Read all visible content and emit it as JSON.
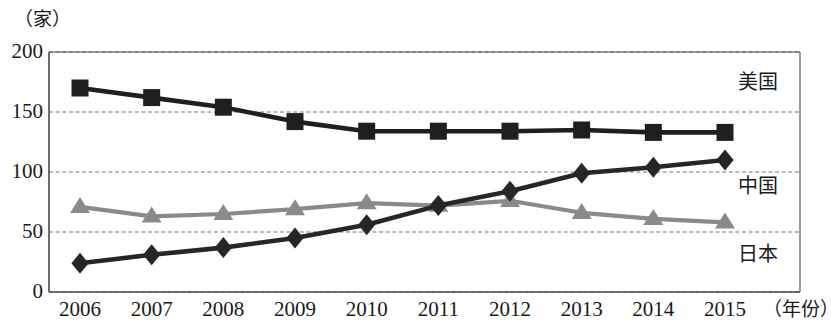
{
  "chart_data": {
    "type": "line",
    "title": "",
    "subtitle": "",
    "xlabel": "（年份）",
    "ylabel": "（家）",
    "categories": [
      "2006",
      "2007",
      "2008",
      "2009",
      "2010",
      "2011",
      "2012",
      "2013",
      "2014",
      "2015"
    ],
    "x": [
      2006,
      2007,
      2008,
      2009,
      2010,
      2011,
      2012,
      2013,
      2014,
      2015
    ],
    "xlim": [
      2006,
      2015
    ],
    "ylim": [
      0,
      200
    ],
    "yticks": [
      0,
      50,
      100,
      150,
      200
    ],
    "ytick_labels": [
      "0",
      "50",
      "100",
      "150",
      "200"
    ],
    "grid": true,
    "grid_style": "dashed",
    "legend": "inline-right-labels",
    "series": [
      {
        "name": "美国",
        "marker": "square",
        "color": "#1f1f1f",
        "values": [
          170,
          162,
          154,
          142,
          134,
          134,
          134,
          135,
          133,
          133
        ]
      },
      {
        "name": "中国",
        "marker": "diamond",
        "color": "#262626",
        "values": [
          24,
          31,
          37,
          45,
          56,
          72,
          84,
          99,
          104,
          110
        ]
      },
      {
        "name": "日本",
        "marker": "triangle",
        "color": "#8a8a8a",
        "values": [
          71,
          63,
          65,
          69,
          74,
          72,
          76,
          66,
          61,
          58
        ]
      }
    ]
  },
  "labels": {
    "unit": "（家）",
    "year_axis": "（年份）",
    "series_usa": "美国",
    "series_china": "中国",
    "series_japan": "日本"
  },
  "colors": {
    "usa": "#1f1f1f",
    "china": "#262626",
    "japan": "#8a8a8a",
    "grid": "#777777",
    "axis": "#4a4a4a",
    "background": "#ffffff"
  }
}
